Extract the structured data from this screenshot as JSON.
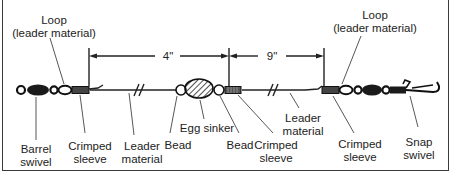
{
  "diagram": {
    "labels": {
      "loop_left_line1": "Loop",
      "loop_left_line2": "(leader material)",
      "loop_right_line1": "Loop",
      "loop_right_line2": "(leader material)",
      "barrel_swivel_line1": "Barrel",
      "barrel_swivel_line2": "swivel",
      "crimped_sleeve_left_line1": "Crimped",
      "crimped_sleeve_left_line2": "sleeve",
      "leader_left_line1": "Leader",
      "leader_left_line2": "material",
      "bead_left": "Bead",
      "egg_sinker": "Egg sinker",
      "bead_right": "Bead",
      "crimped_sleeve_mid_line1": "Crimped",
      "crimped_sleeve_mid_line2": "sleeve",
      "leader_right_line1": "Leader",
      "leader_right_line2": "material",
      "crimped_sleeve_right_line1": "Crimped",
      "crimped_sleeve_right_line2": "sleeve",
      "snap_swivel_line1": "Snap",
      "snap_swivel_line2": "swivel"
    },
    "dimensions": {
      "left_span": "4\"",
      "right_span": "9\""
    }
  }
}
